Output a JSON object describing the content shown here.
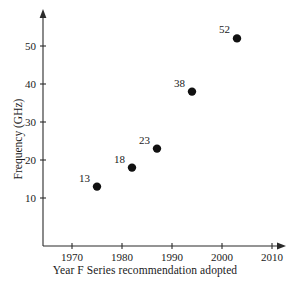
{
  "chart_data": {
    "type": "scatter",
    "title": "",
    "xlabel": "Year F Series recommendation adopted",
    "ylabel": "Frequency (GHz)",
    "xlim": [
      1964,
      2013
    ],
    "ylim": [
      0,
      56
    ],
    "xticks": [
      1970,
      1980,
      1990,
      2000,
      2010
    ],
    "xtick_labels": [
      "1970",
      "1980",
      "1990",
      "2000",
      "2010"
    ],
    "yticks": [
      10,
      20,
      30,
      40,
      50
    ],
    "ytick_labels": [
      "10",
      "20",
      "30",
      "40",
      "50"
    ],
    "grid": false,
    "legend": "none",
    "marker": "filled-circle",
    "marker_color": "#111111",
    "axis_color": "#2b2b2b",
    "points": [
      {
        "x": 1975,
        "y": 13,
        "label": "13"
      },
      {
        "x": 1982,
        "y": 18,
        "label": "18"
      },
      {
        "x": 1987,
        "y": 23,
        "label": "23"
      },
      {
        "x": 1994,
        "y": 38,
        "label": "38"
      },
      {
        "x": 2003,
        "y": 52,
        "label": "52"
      }
    ]
  }
}
